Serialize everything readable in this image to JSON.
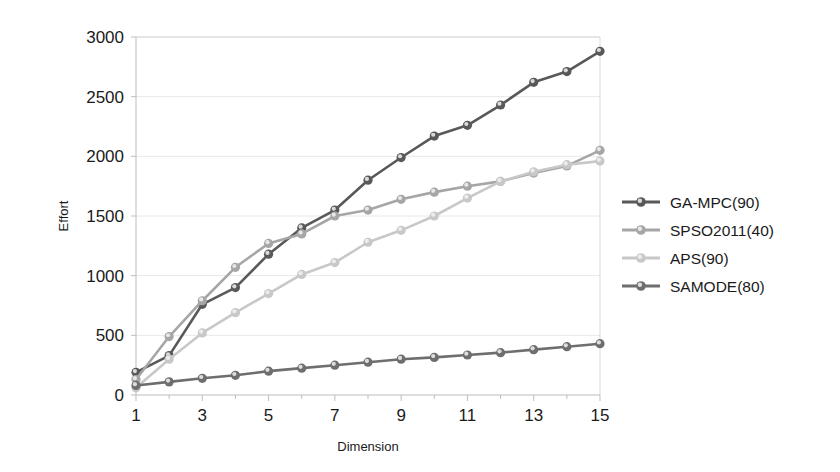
{
  "chart_data": {
    "type": "line",
    "title": "",
    "xlabel": "Dimension",
    "ylabel": "Effort",
    "xlim": [
      1,
      15
    ],
    "ylim": [
      0,
      3000
    ],
    "grid": true,
    "legend_position": "right",
    "x": [
      1,
      2,
      3,
      4,
      5,
      6,
      7,
      8,
      9,
      10,
      11,
      12,
      13,
      14,
      15
    ],
    "xticks": [
      1,
      3,
      5,
      7,
      9,
      11,
      13,
      15
    ],
    "xticklabels": [
      "1",
      "3",
      "5",
      "7",
      "9",
      "11",
      "13",
      "15"
    ],
    "yticks": [
      0,
      500,
      1000,
      1500,
      2000,
      2500,
      3000
    ],
    "yticklabels": [
      "0",
      "500",
      "1000",
      "1500",
      "2000",
      "2500",
      "3000"
    ],
    "series": [
      {
        "name": "GA-MPC(90)",
        "color": "#595959",
        "marker": "circle",
        "values": [
          190,
          330,
          760,
          900,
          1180,
          1400,
          1550,
          1800,
          1990,
          2170,
          2260,
          2430,
          2620,
          2710,
          2880
        ]
      },
      {
        "name": "SPSO2011(40)",
        "color": "#a6a6a6",
        "marker": "circle",
        "values": [
          130,
          490,
          790,
          1070,
          1270,
          1350,
          1500,
          1550,
          1640,
          1700,
          1750,
          1790,
          1860,
          1920,
          2050
        ]
      },
      {
        "name": "APS(90)",
        "color": "#c8c8c8",
        "marker": "circle",
        "values": [
          60,
          300,
          520,
          690,
          850,
          1010,
          1110,
          1280,
          1380,
          1500,
          1650,
          1790,
          1870,
          1930,
          1960
        ]
      },
      {
        "name": "SAMODE(80)",
        "color": "#6e6e6e",
        "marker": "circle",
        "values": [
          80,
          110,
          140,
          165,
          200,
          225,
          250,
          275,
          300,
          315,
          335,
          355,
          380,
          405,
          430
        ]
      }
    ]
  },
  "legend": {
    "items": [
      {
        "label": "GA-MPC(90)"
      },
      {
        "label": "SPSO2011(40)"
      },
      {
        "label": "APS(90)"
      },
      {
        "label": "SAMODE(80)"
      }
    ]
  }
}
